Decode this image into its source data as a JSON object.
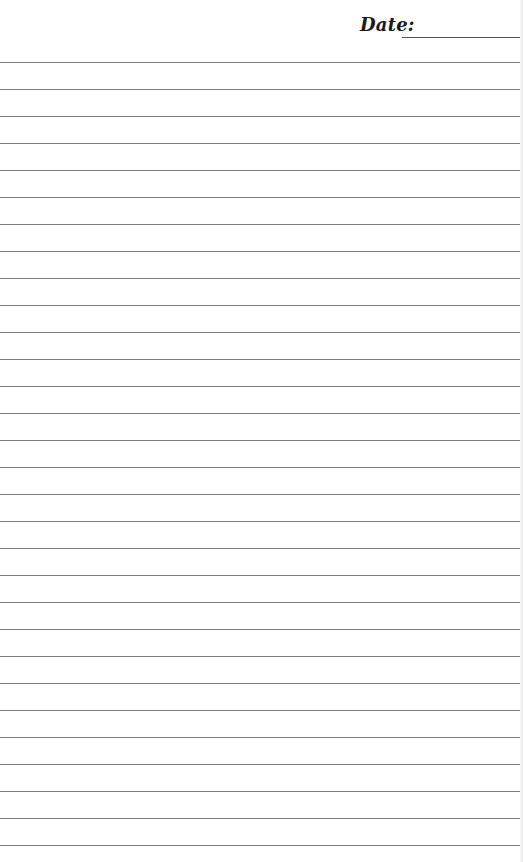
{
  "header": {
    "date_label": "Date:",
    "date_value": ""
  },
  "lines": {
    "count": 30,
    "first_y": 62,
    "spacing": 27,
    "color": "#7d7d7d"
  }
}
